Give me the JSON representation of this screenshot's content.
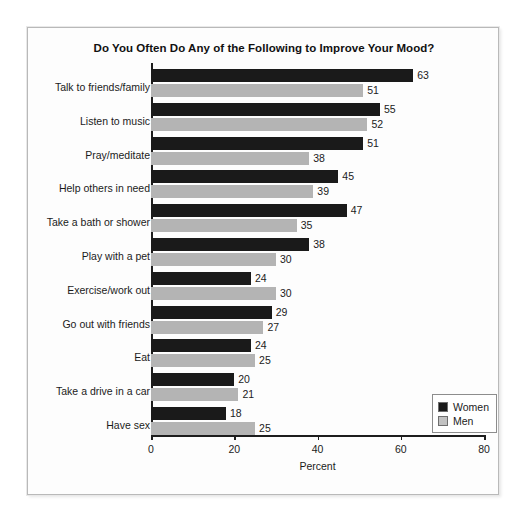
{
  "chart_data": {
    "type": "bar",
    "orientation": "horizontal",
    "title": "Do You Often Do Any of the Following to Improve Your Mood?",
    "xlabel": "Percent",
    "ylabel": "",
    "xlim": [
      0,
      80
    ],
    "xticks": [
      0,
      20,
      40,
      60,
      80
    ],
    "grid": false,
    "legend_position": "bottom-right",
    "categories": [
      "Talk to friends/family",
      "Listen to music",
      "Pray/meditate",
      "Help others in need",
      "Take a bath or shower",
      "Play with a pet",
      "Exercise/work out",
      "Go out with friends",
      "Eat",
      "Take a drive in a car",
      "Have sex"
    ],
    "series": [
      {
        "name": "Women",
        "color": "#1a1a1a",
        "values": [
          63,
          55,
          51,
          45,
          47,
          38,
          24,
          29,
          24,
          20,
          18
        ]
      },
      {
        "name": "Men",
        "color": "#b4b4b4",
        "values": [
          51,
          52,
          38,
          39,
          35,
          30,
          30,
          27,
          25,
          21,
          25
        ]
      }
    ]
  },
  "legend": {
    "entries": [
      {
        "label": "Women"
      },
      {
        "label": "Men"
      }
    ]
  }
}
